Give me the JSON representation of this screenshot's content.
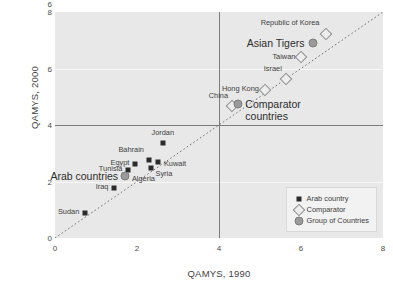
{
  "chart_data": {
    "type": "scatter",
    "title": "",
    "xlabel": "QAMYS, 1990",
    "ylabel": "QAMYS, 2000",
    "xlim": [
      0,
      8
    ],
    "ylim": [
      0,
      8
    ],
    "xticks": [
      "0",
      "2",
      "4",
      "6",
      "8"
    ],
    "yticks": [
      "0",
      "2",
      "4",
      "6",
      "8"
    ],
    "xtick_values": [
      0,
      2,
      4,
      6,
      8
    ],
    "ytick_values": [
      0,
      2,
      4,
      6,
      8
    ],
    "grid": "faint horizontal gridlines at y=2 and y=6",
    "reference_lines": {
      "vertical_x": 4,
      "horizontal_y": 4,
      "diagonal": "y = x (dotted 45-degree line)"
    },
    "legend": {
      "position": "bottom-right inside plot",
      "entries": [
        {
          "marker": "filled-square",
          "label": "Arab country"
        },
        {
          "marker": "open-diamond",
          "label": "Comparator"
        },
        {
          "marker": "filled-circle",
          "label": "Group of Countries"
        }
      ]
    },
    "series": [
      {
        "name": "Arab country",
        "marker": "filled-square",
        "points": [
          {
            "label": "Jordan",
            "x": 2.63,
            "y": 3.38,
            "label_pos": "above"
          },
          {
            "label": "Bahrain",
            "x": 2.29,
            "y": 2.78,
            "label_pos": "upper-left"
          },
          {
            "label": "Kuwait",
            "x": 2.51,
            "y": 2.69,
            "label_pos": "right"
          },
          {
            "label": "Egypt",
            "x": 1.96,
            "y": 2.62,
            "label_pos": "left"
          },
          {
            "label": "Syria",
            "x": 2.33,
            "y": 2.47,
            "label_pos": "below-right"
          },
          {
            "label": "Tunisia",
            "x": 1.79,
            "y": 2.4,
            "label_pos": "left"
          },
          {
            "label": "Algeria",
            "x": 1.73,
            "y": 2.18,
            "label_pos": "right"
          },
          {
            "label": "Iraq",
            "x": 1.45,
            "y": 1.76,
            "label_pos": "left"
          },
          {
            "label": "Sudan",
            "x": 0.74,
            "y": 0.88,
            "label_pos": "left"
          }
        ]
      },
      {
        "name": "Comparator",
        "marker": "open-diamond",
        "points": [
          {
            "label": "Republic of Korea",
            "x": 6.62,
            "y": 7.22,
            "label_pos": "upper-left"
          },
          {
            "label": "Taiwan",
            "x": 6.01,
            "y": 6.42,
            "label_pos": "left"
          },
          {
            "label": "Israel",
            "x": 5.63,
            "y": 5.63,
            "label_pos": "upper-left"
          },
          {
            "label": "Hong Kong",
            "x": 5.12,
            "y": 5.24,
            "label_pos": "left"
          },
          {
            "label": "China",
            "x": 4.32,
            "y": 4.67,
            "label_pos": "upper-left"
          }
        ]
      },
      {
        "name": "Group of Countries",
        "marker": "filled-circle",
        "points": [
          {
            "label": "Asian Tigers",
            "x": 6.28,
            "y": 6.9,
            "label_pos": "left"
          },
          {
            "label": "Comparator countries",
            "x": 4.47,
            "y": 4.74,
            "label_pos": "right"
          },
          {
            "label": "Arab countries",
            "x": 1.71,
            "y": 2.18,
            "label_pos": "left"
          }
        ]
      }
    ]
  }
}
